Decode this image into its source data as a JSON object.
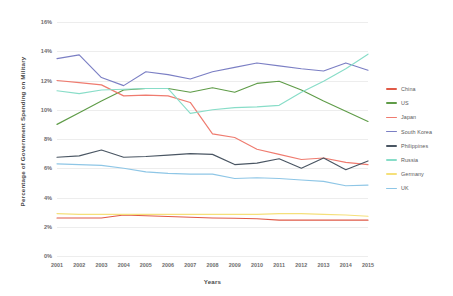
{
  "chart_data": {
    "type": "line",
    "title": "",
    "xlabel": "Years",
    "ylabel": "Percentage of Government Spending on Military",
    "categories": [
      "2001",
      "2002",
      "2003",
      "2004",
      "2005",
      "2006",
      "2007",
      "2008",
      "2009",
      "2010",
      "2011",
      "2012",
      "2013",
      "2014",
      "2015"
    ],
    "x": [
      2001,
      2002,
      2003,
      2004,
      2005,
      2006,
      2007,
      2008,
      2009,
      2010,
      2011,
      2012,
      2013,
      2014,
      2015
    ],
    "ylim": [
      0,
      16
    ],
    "ytick_labels": [
      "0%",
      "2%",
      "4%",
      "6%",
      "8%",
      "10%",
      "12%",
      "14%",
      "16%"
    ],
    "ytick_values": [
      0,
      2,
      4,
      6,
      8,
      10,
      12,
      14,
      16
    ],
    "grid": true,
    "legend_position": "right",
    "series": [
      {
        "name": "China",
        "color": "#e05a47",
        "values": [
          2.6,
          2.6,
          2.6,
          2.8,
          2.75,
          2.7,
          2.65,
          2.6,
          2.58,
          2.55,
          2.45,
          2.45,
          2.45,
          2.45,
          2.45
        ]
      },
      {
        "name": "US",
        "color": "#5f9c48",
        "values": [
          9.0,
          9.8,
          10.6,
          11.35,
          11.45,
          11.45,
          11.2,
          11.5,
          11.2,
          11.8,
          11.95,
          11.35,
          10.6,
          9.9,
          9.2
        ]
      },
      {
        "name": "Japan",
        "color": "#ef7b6f",
        "values": [
          12.0,
          11.85,
          11.7,
          10.95,
          11.0,
          10.95,
          10.5,
          8.35,
          8.1,
          7.3,
          6.95,
          6.6,
          6.7,
          6.4,
          6.25
        ]
      },
      {
        "name": "South Korea",
        "color": "#7b7fc4",
        "values": [
          13.5,
          13.75,
          12.2,
          11.65,
          12.6,
          12.4,
          12.1,
          12.6,
          12.9,
          13.2,
          13.0,
          12.8,
          12.65,
          13.2,
          12.7
        ]
      },
      {
        "name": "Philippines",
        "color": "#4a5663",
        "values": [
          6.75,
          6.85,
          7.25,
          6.75,
          6.8,
          6.9,
          7.0,
          6.95,
          6.25,
          6.35,
          6.65,
          6.0,
          6.7,
          5.9,
          6.5
        ]
      },
      {
        "name": "Russia",
        "color": "#88ddc8",
        "values": [
          11.3,
          11.1,
          11.35,
          11.4,
          11.45,
          11.45,
          9.75,
          10.0,
          10.15,
          10.2,
          10.3,
          11.2,
          11.95,
          12.8,
          13.8
        ]
      },
      {
        "name": "Germany",
        "color": "#f5e07a",
        "values": [
          2.9,
          2.85,
          2.85,
          2.85,
          2.85,
          2.85,
          2.85,
          2.85,
          2.85,
          2.85,
          2.9,
          2.9,
          2.85,
          2.8,
          2.72
        ]
      },
      {
        "name": "UK",
        "color": "#8ec6e6",
        "values": [
          6.3,
          6.25,
          6.2,
          6.0,
          5.75,
          5.65,
          5.6,
          5.6,
          5.3,
          5.35,
          5.3,
          5.2,
          5.1,
          4.8,
          4.85
        ]
      }
    ]
  },
  "legend": {
    "items": [
      {
        "label": "China",
        "color": "#e05a47"
      },
      {
        "label": "US",
        "color": "#5f9c48"
      },
      {
        "label": "Japan",
        "color": "#ef7b6f"
      },
      {
        "label": "South Korea",
        "color": "#7b7fc4"
      },
      {
        "label": "Philippines",
        "color": "#4a5663"
      },
      {
        "label": "Russia",
        "color": "#88ddc8"
      },
      {
        "label": "Germany",
        "color": "#f5e07a"
      },
      {
        "label": "UK",
        "color": "#8ec6e6"
      }
    ]
  },
  "axes": {
    "x_title": "Years",
    "y_title": "Percentage of Government Spending on Military"
  }
}
